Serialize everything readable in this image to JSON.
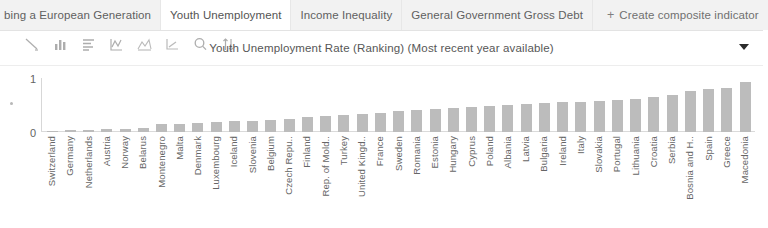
{
  "tabs": [
    {
      "label": "bing a European Generation",
      "active": false,
      "clipped": true
    },
    {
      "label": "Youth Unemployment",
      "active": true,
      "clipped": false
    },
    {
      "label": "Income Inequality",
      "active": false,
      "clipped": false
    },
    {
      "label": "General Government Gross Debt",
      "active": false,
      "clipped": false
    }
  ],
  "create_tab": {
    "label": "Create composite indicator",
    "plus": "+"
  },
  "toolbar": {
    "icons": [
      "line-tool-icon",
      "bar-chart-icon",
      "horizontal-bar-chart-icon",
      "line-chart-icon",
      "area-chart-icon",
      "scatter-chart-icon",
      "zoom-search-icon",
      "sort-icon"
    ],
    "title": "Youth Unemployment Rate (Ranking)  (Most recent year available)",
    "dropdown_icon": "chevron-down-icon"
  },
  "chart_data": {
    "type": "bar",
    "title": "Youth Unemployment Rate (Ranking)  (Most recent year available)",
    "xlabel": "",
    "ylabel": "",
    "ylim": [
      0,
      1
    ],
    "yticks": [
      "0",
      "1"
    ],
    "grid": false,
    "legend": "none",
    "bar_color": "#b9b9b9",
    "categories": [
      "Switzerland",
      "Germany",
      "Netherlands",
      "Austria",
      "Norway",
      "Belarus",
      "Montenegro",
      "Malta",
      "Denmark",
      "Luxembourg",
      "Iceland",
      "Slovenia",
      "Belgium",
      "Czech Repu..",
      "Finland",
      "Rep. of Mold..",
      "Turkey",
      "United Kingd..",
      "France",
      "Sweden",
      "Romania",
      "Estonia",
      "Hungary",
      "Cyprus",
      "Poland",
      "Albania",
      "Latvia",
      "Bulgaria",
      "Ireland",
      "Italy",
      "Slovakia",
      "Portugal",
      "Lithuania",
      "Croatia",
      "Serbia",
      "Bosnia and H..",
      "Spain",
      "Greece",
      "Macedonia"
    ],
    "values": [
      0.02,
      0.03,
      0.04,
      0.05,
      0.06,
      0.07,
      0.14,
      0.15,
      0.16,
      0.18,
      0.2,
      0.21,
      0.23,
      0.25,
      0.28,
      0.3,
      0.32,
      0.34,
      0.36,
      0.38,
      0.4,
      0.42,
      0.44,
      0.46,
      0.48,
      0.5,
      0.52,
      0.54,
      0.56,
      0.55,
      0.58,
      0.6,
      0.62,
      0.64,
      0.68,
      0.76,
      0.8,
      0.82,
      0.93
    ]
  }
}
